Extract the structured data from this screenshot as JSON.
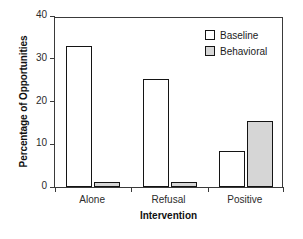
{
  "chart_data": {
    "type": "bar",
    "title": "",
    "xlabel": "Intervention",
    "ylabel": "Percentage of Opportunities",
    "categories": [
      "Alone",
      "Refusal",
      "Positive"
    ],
    "series": [
      {
        "name": "Baseline",
        "values": [
          32.9,
          25.2,
          8.4
        ],
        "color": "#ffffff"
      },
      {
        "name": "Behavioral",
        "values": [
          1.1,
          1.1,
          15.4
        ],
        "color": "#d6d6d6"
      }
    ],
    "ylim": [
      0,
      40
    ],
    "yticks": [
      0,
      10,
      20,
      30,
      40
    ],
    "ytick_labels": [
      "0",
      "10",
      "20",
      "30",
      "40"
    ],
    "grid": false,
    "legend_position": "top-right",
    "frame": true
  },
  "legend": {
    "entries": [
      {
        "label": "Baseline"
      },
      {
        "label": "Behavioral"
      }
    ]
  },
  "axes": {
    "y_title": "Percentage of Opportunities",
    "x_title": "Intervention"
  }
}
